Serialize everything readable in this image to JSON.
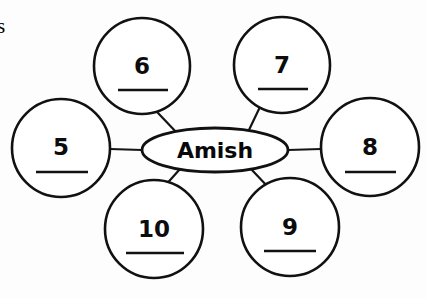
{
  "page": {
    "background_color": "#fdfdfd",
    "ink_color": "#111111",
    "width": 427,
    "height": 298,
    "artifact_text": "s"
  },
  "diagram": {
    "type": "word-web",
    "center": {
      "label": "Amish",
      "shape": "ellipse",
      "cx": 215,
      "cy": 150,
      "rx": 73,
      "ry": 22
    },
    "nodes": [
      {
        "id": "node-5",
        "label": "5",
        "shape": "circle",
        "cx": 61,
        "cy": 148,
        "r": 49,
        "answer_line": true,
        "answer_value": "",
        "position": "left"
      },
      {
        "id": "node-6",
        "label": "6",
        "shape": "circle",
        "cx": 142,
        "cy": 66,
        "r": 48,
        "answer_line": true,
        "answer_value": "",
        "position": "top-left"
      },
      {
        "id": "node-7",
        "label": "7",
        "shape": "circle",
        "cx": 282,
        "cy": 65,
        "r": 48,
        "answer_line": true,
        "answer_value": "",
        "position": "top-right"
      },
      {
        "id": "node-8",
        "label": "8",
        "shape": "circle",
        "cx": 370,
        "cy": 147,
        "r": 49,
        "answer_line": true,
        "answer_value": "",
        "position": "right"
      },
      {
        "id": "node-9",
        "label": "9",
        "shape": "circle",
        "cx": 290,
        "cy": 227,
        "r": 49,
        "answer_line": true,
        "answer_value": "",
        "position": "bottom-right"
      },
      {
        "id": "node-10",
        "label": "10",
        "shape": "circle",
        "cx": 154,
        "cy": 229,
        "r": 49,
        "answer_line": true,
        "answer_value": "",
        "position": "bottom-left"
      }
    ],
    "edges": [
      {
        "id": "edge-center-5",
        "from": "center",
        "to": "node-5",
        "x1": 142,
        "y1": 150,
        "x2": 110,
        "y2": 149
      },
      {
        "id": "edge-center-6",
        "from": "center",
        "to": "node-6",
        "x1": 178,
        "y1": 134,
        "x2": 158,
        "y2": 113
      },
      {
        "id": "edge-center-7",
        "from": "center",
        "to": "node-7",
        "x1": 248,
        "y1": 132,
        "x2": 259,
        "y2": 109
      },
      {
        "id": "edge-center-8",
        "from": "center",
        "to": "node-8",
        "x1": 288,
        "y1": 150,
        "x2": 321,
        "y2": 149
      },
      {
        "id": "edge-center-9",
        "from": "center",
        "to": "node-9",
        "x1": 251,
        "y1": 169,
        "x2": 269,
        "y2": 188
      },
      {
        "id": "edge-center-10",
        "from": "center",
        "to": "node-10",
        "x1": 180,
        "y1": 169,
        "x2": 163,
        "y2": 188
      }
    ]
  }
}
